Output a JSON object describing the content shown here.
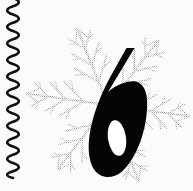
{
  "canvas": {
    "width": 193,
    "height": 191,
    "background_color": "#fbfbfb",
    "description": "Decorative clip-art: a bold italic numeral six over a gray snowflake, with a vertical wavy line at the left edge"
  },
  "squiggle": {
    "name": "wavy vertical line",
    "color": "#111111",
    "stroke_width": 2.6,
    "x_center": 13,
    "amplitude": 8,
    "y_start": -2,
    "y_end": 178,
    "wavelength": 16.5
  },
  "snowflake": {
    "name": "snowflake",
    "color": "#b4b4b4",
    "center_x": 108,
    "center_y": 105,
    "radius": 82,
    "arm_count": 6,
    "rotation_deg": 8,
    "branch_pairs": 3,
    "stroke_width": 2.2,
    "opacity": 0.95
  },
  "digit": {
    "name": "numeral six",
    "value": "6",
    "color": "#050505",
    "style": "bold italic",
    "bounds": {
      "x": 88,
      "y": 48,
      "width": 60,
      "height": 129
    },
    "counter": {
      "center_x": 117,
      "center_y": 138,
      "rx": 9,
      "ry": 18,
      "color": "#ffffff"
    }
  }
}
